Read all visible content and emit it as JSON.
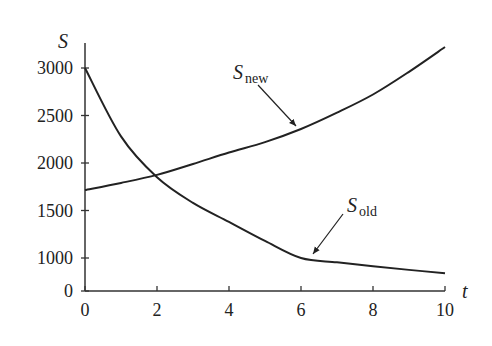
{
  "chart_data": {
    "type": "line",
    "title": "",
    "xlabel": "t",
    "ylabel": "S",
    "xlim": [
      0,
      10
    ],
    "ylim": [
      0,
      3250
    ],
    "axis_break": {
      "between": [
        0,
        1000
      ],
      "note": "y-axis jumps from 0 directly to 1000"
    },
    "grid": false,
    "legend": "none (curves labeled with arrows)",
    "x_ticks": [
      0,
      2,
      4,
      6,
      8,
      10
    ],
    "y_ticks": [
      0,
      1000,
      1500,
      2000,
      2500,
      3000
    ],
    "x_tick_labels": [
      "0",
      "2",
      "4",
      "6",
      "8",
      "10"
    ],
    "y_tick_labels": [
      "0",
      "1000",
      "1500",
      "2000",
      "2500",
      "3000"
    ],
    "x": [
      0,
      1,
      2,
      3,
      4,
      5,
      6,
      7,
      8,
      9,
      10
    ],
    "series": [
      {
        "name": "S_new",
        "label_main": "S",
        "label_sub": "new",
        "values": [
          1716,
          1790,
          1875,
          1990,
          2110,
          2220,
          2358,
          2530,
          2721,
          2960,
          3221
        ],
        "annotation": {
          "text_x": 233,
          "text_y": 79,
          "arrow_from": [
            258,
            85
          ],
          "arrow_to": [
            296,
            126
          ]
        }
      },
      {
        "name": "S_old",
        "label_main": "S",
        "label_sub": "old",
        "values": [
          3000,
          2280,
          1850,
          1580,
          1380,
          1180,
          1000,
          870,
          750,
          640,
          540
        ],
        "annotation": {
          "text_x": 347,
          "text_y": 212,
          "arrow_from": [
            343,
            214
          ],
          "arrow_to": [
            313,
            254
          ]
        }
      }
    ],
    "colors": {
      "line": "#222222",
      "axis": "#333333"
    }
  }
}
